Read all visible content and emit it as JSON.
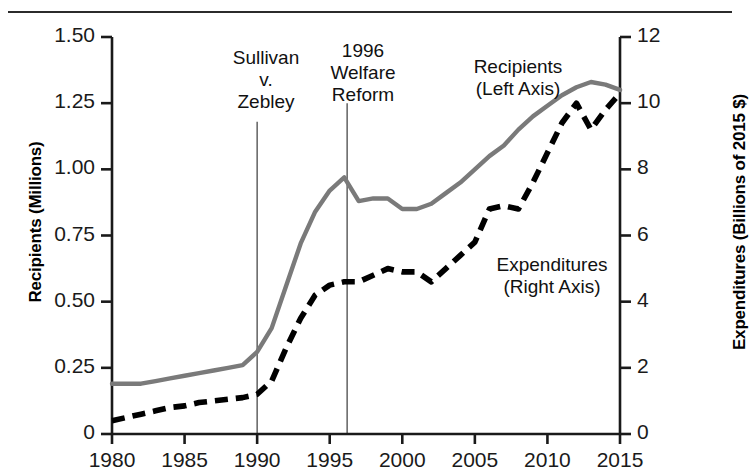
{
  "figure": {
    "top_rule": true,
    "background": "#ffffff"
  },
  "axes": {
    "left": {
      "title": "Recipients (Millions)",
      "ticks": [
        "1.50",
        "1.25",
        "1.00",
        "0.75",
        "0.50",
        "0.25",
        "0"
      ],
      "tick_values": [
        1.5,
        1.25,
        1.0,
        0.75,
        0.5,
        0.25,
        0
      ],
      "min": 0,
      "max": 1.5
    },
    "right": {
      "title": "Expenditures (Billions of 2015 $)",
      "ticks": [
        "12",
        "10",
        "8",
        "6",
        "4",
        "2",
        "0"
      ],
      "tick_values": [
        12,
        10,
        8,
        6,
        4,
        2,
        0
      ],
      "min": 0,
      "max": 12
    },
    "bottom": {
      "ticks": [
        "1980",
        "1985",
        "1990",
        "1995",
        "2000",
        "2005",
        "2010",
        "2015"
      ],
      "tick_values": [
        1980,
        1985,
        1990,
        1995,
        2000,
        2005,
        2010,
        2015
      ],
      "min": 1980,
      "max": 2015
    }
  },
  "annotations": [
    {
      "id": "sullivan",
      "text": "Sullivan\nv.\nZebley",
      "year": 1990,
      "line_top_value": 1.18,
      "line_bottom_value": 0
    },
    {
      "id": "welfare-reform",
      "text": "1996\nWelfare\nReform",
      "year": 1996.2,
      "line_top_value": 1.25,
      "line_bottom_value": 0
    }
  ],
  "series_labels": [
    {
      "id": "recipients",
      "text": "Recipients\n(Left Axis)"
    },
    {
      "id": "expenditures",
      "text": "Expenditures\n(Right Axis)"
    }
  ],
  "colors": {
    "recipients_line": "#7a7a7a",
    "expenditures_line": "#000000",
    "axis": "#1a1a1a",
    "annotation_line": "#555555",
    "text": "#111111"
  },
  "chart_data": {
    "type": "line",
    "title": "",
    "subtitle": "",
    "xlabel": "",
    "ylabel": "Recipients (Millions)",
    "y2label": "Expenditures (Billions of 2015 $)",
    "xlim": [
      1980,
      2015
    ],
    "ylim": [
      0,
      1.5
    ],
    "y2lim": [
      0,
      12
    ],
    "grid": false,
    "legend": "inline-annotations",
    "x": [
      1980,
      1981,
      1982,
      1983,
      1984,
      1985,
      1986,
      1987,
      1988,
      1989,
      1990,
      1991,
      1992,
      1993,
      1994,
      1995,
      1996,
      1997,
      1998,
      1999,
      2000,
      2001,
      2002,
      2003,
      2004,
      2005,
      2006,
      2007,
      2008,
      2009,
      2010,
      2011,
      2012,
      2013,
      2014,
      2015
    ],
    "series": [
      {
        "name": "Recipients (Left Axis)",
        "axis": "left",
        "units": "Millions",
        "style": "solid",
        "color": "#7a7a7a",
        "values": [
          0.19,
          0.19,
          0.19,
          0.2,
          0.21,
          0.22,
          0.23,
          0.24,
          0.25,
          0.26,
          0.31,
          0.4,
          0.56,
          0.72,
          0.84,
          0.92,
          0.97,
          0.88,
          0.89,
          0.89,
          0.85,
          0.85,
          0.87,
          0.91,
          0.95,
          1.0,
          1.05,
          1.09,
          1.15,
          1.2,
          1.24,
          1.28,
          1.31,
          1.33,
          1.32,
          1.3
        ]
      },
      {
        "name": "Expenditures (Right Axis)",
        "axis": "right",
        "units": "Billions of 2015 $",
        "style": "dashed",
        "color": "#000000",
        "values": [
          0.4,
          0.5,
          0.6,
          0.7,
          0.8,
          0.85,
          0.95,
          1.0,
          1.05,
          1.1,
          1.2,
          1.6,
          2.6,
          3.5,
          4.2,
          4.5,
          4.6,
          4.6,
          4.8,
          5.0,
          4.9,
          4.9,
          4.6,
          5.0,
          5.4,
          5.8,
          6.8,
          6.9,
          6.8,
          7.6,
          8.5,
          9.4,
          10.0,
          9.2,
          9.8,
          10.3
        ]
      }
    ],
    "annotations": [
      {
        "text": "Sullivan v. Zebley",
        "x": 1990,
        "type": "vertical-line"
      },
      {
        "text": "1996 Welfare Reform",
        "x": 1996,
        "type": "vertical-line"
      }
    ]
  }
}
